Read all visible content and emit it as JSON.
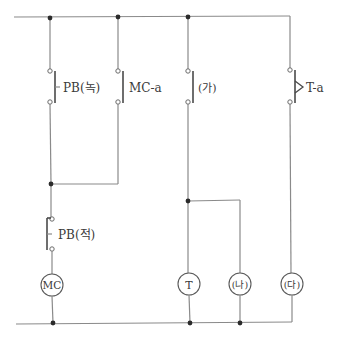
{
  "diagram": {
    "type": "relay-sequence-circuit",
    "labels": {
      "pb_start": "PB(녹)",
      "mc_a": "MC-a",
      "ga": "(가)",
      "t_a": "T-a",
      "pb_stop": "PB(적)",
      "mc_coil": "MC",
      "t_coil": "T",
      "na": "(나)",
      "da": "(다)"
    },
    "colors": {
      "wire": "#8a8a8a",
      "junction": "#2b2b2b",
      "text": "#3a3a3a"
    }
  }
}
